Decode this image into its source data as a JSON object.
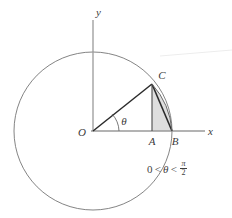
{
  "figure": {
    "type": "geometry-diagram",
    "background_color": "#ffffff",
    "stroke_color": "#6e6e6e",
    "bold_stroke_color": "#2b2b2b",
    "shade_color": "#c9c9c9",
    "label_color": "#3a3a3a"
  },
  "axes": {
    "x_label": "x",
    "y_label": "y",
    "origin_label": "O"
  },
  "points": [
    {
      "id": "O",
      "label": "O",
      "x": 93,
      "y": 131
    },
    {
      "id": "A",
      "label": "A",
      "x": 152,
      "y": 131
    },
    {
      "id": "B",
      "label": "B",
      "x": 172,
      "y": 131
    },
    {
      "id": "C",
      "label": "C",
      "x": 152,
      "y": 84
    }
  ],
  "angle": {
    "label": "θ",
    "vertex": "O",
    "value_deg": 55
  },
  "circle": {
    "center_x": 93,
    "center_y": 131,
    "radius": 79
  },
  "inequality": {
    "lower": "0",
    "rel1": "<",
    "variable": "θ",
    "rel2": "<",
    "numerator": "π",
    "denominator": "2",
    "full_text": "0 < θ < π/2"
  }
}
